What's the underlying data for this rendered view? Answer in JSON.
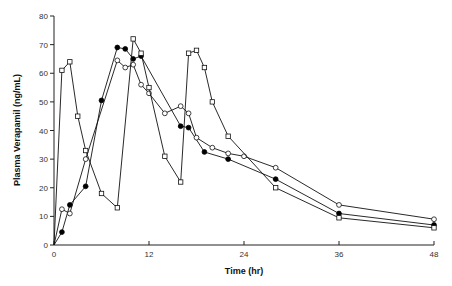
{
  "chart_data": {
    "type": "line",
    "title": "",
    "xlabel": "Time (hr)",
    "ylabel": "Plasma Verapamil (ng/mL)",
    "xlim": [
      0,
      48
    ],
    "ylim": [
      0,
      80
    ],
    "xticks": [
      0,
      12,
      24,
      36,
      48
    ],
    "yticks": [
      0,
      10,
      20,
      30,
      40,
      50,
      60,
      70,
      80
    ],
    "grid": false,
    "legend": null,
    "series": [
      {
        "name": "filled circles",
        "marker": "filled-circle",
        "points": [
          [
            0,
            0
          ],
          [
            1,
            4.5
          ],
          [
            2,
            14
          ],
          [
            4,
            20.5
          ],
          [
            6,
            50.5
          ],
          [
            8,
            69
          ],
          [
            9,
            68.5
          ],
          [
            10,
            65
          ],
          [
            11,
            66
          ],
          [
            16,
            41.5
          ],
          [
            17,
            41
          ],
          [
            19,
            32.5
          ],
          [
            22,
            30
          ],
          [
            28,
            23
          ],
          [
            36,
            11
          ],
          [
            48,
            7
          ]
        ]
      },
      {
        "name": "open circles",
        "marker": "open-circle",
        "points": [
          [
            0,
            0
          ],
          [
            1,
            12.5
          ],
          [
            2,
            11
          ],
          [
            4,
            30
          ],
          [
            8,
            64.5
          ],
          [
            9,
            62
          ],
          [
            10,
            63
          ],
          [
            11,
            56
          ],
          [
            12,
            53
          ],
          [
            14,
            46
          ],
          [
            16,
            48.5
          ],
          [
            17,
            46
          ],
          [
            18,
            37.5
          ],
          [
            20,
            34
          ],
          [
            22,
            32
          ],
          [
            24,
            31
          ],
          [
            28,
            27
          ],
          [
            36,
            14
          ],
          [
            48,
            9
          ]
        ]
      },
      {
        "name": "open squares",
        "marker": "open-square",
        "points": [
          [
            0,
            0
          ],
          [
            1,
            61
          ],
          [
            2,
            64
          ],
          [
            3,
            45
          ],
          [
            4,
            33
          ],
          [
            6,
            18
          ],
          [
            8,
            13
          ],
          [
            10,
            72
          ],
          [
            11,
            67
          ],
          [
            12,
            55
          ],
          [
            14,
            31
          ],
          [
            16,
            22
          ],
          [
            17,
            67
          ],
          [
            18,
            68
          ],
          [
            19,
            62
          ],
          [
            20,
            50
          ],
          [
            22,
            38
          ],
          [
            28,
            20
          ],
          [
            36,
            9.5
          ],
          [
            48,
            6
          ]
        ]
      }
    ]
  }
}
